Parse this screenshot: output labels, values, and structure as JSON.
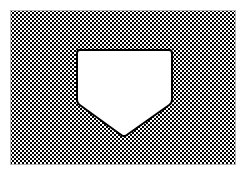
{
  "figure": {
    "title": "Hatched rectangular region with pentagonal cutout",
    "canvas": {
      "width": 246,
      "height": 174,
      "background_color": "#ffffff"
    },
    "hatched_region": {
      "label": "hatched-background-rectangle",
      "x": 10,
      "y": 10,
      "width": 226,
      "height": 155,
      "fill_pattern": "checkerboard",
      "pattern_cell_size_px": 2,
      "pattern_period_px": 4,
      "pattern_dark_color": "#000000",
      "pattern_light_color": "#ffffff",
      "border_color": "#b4b4b4",
      "border_width_px": 1
    },
    "cutout_shape": {
      "label": "home-plate-pentagon-cutout",
      "shape_type": "pentagon",
      "description": "point-down home plate outline",
      "fill_color": "#ffffff",
      "stroke_color": "#000000",
      "stroke_width_px": 2,
      "corner_radius_px": 3,
      "vertices": [
        {
          "name": "top-left",
          "x": 77,
          "y": 50
        },
        {
          "name": "top-right",
          "x": 172,
          "y": 50
        },
        {
          "name": "right",
          "x": 172,
          "y": 103
        },
        {
          "name": "bottom-point",
          "x": 124,
          "y": 137
        },
        {
          "name": "left",
          "x": 77,
          "y": 103
        }
      ]
    }
  }
}
